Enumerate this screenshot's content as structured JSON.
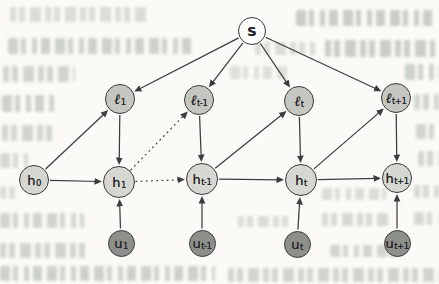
{
  "figure": {
    "type": "graphical-model-diagram",
    "colors": {
      "background": "#fbfaf6",
      "node_border": "#3a3a3a",
      "edge": "#3d3d3d",
      "s_fill": "#fdfdfb",
      "l_fill": "#c6c6c1",
      "h_fill": "#d7d7d2",
      "u_fill": "#8d908a",
      "label": "#242428",
      "bleed_text": "#a9b0a6"
    },
    "nodes": [
      {
        "id": "s",
        "base": "S",
        "sub": "",
        "kind": "s",
        "x": 252,
        "y": 31,
        "r": 14
      },
      {
        "id": "l1",
        "base": "ℓ",
        "sub": "1",
        "kind": "l",
        "x": 120,
        "y": 99,
        "r": 15
      },
      {
        "id": "lt_1",
        "base": "ℓ",
        "sub": "t-1",
        "kind": "l",
        "x": 199,
        "y": 100,
        "r": 15
      },
      {
        "id": "lt",
        "base": "ℓ",
        "sub": "t",
        "kind": "l",
        "x": 299,
        "y": 101,
        "r": 15
      },
      {
        "id": "lt1",
        "base": "ℓ",
        "sub": "t+1",
        "kind": "l",
        "x": 396,
        "y": 98,
        "r": 15
      },
      {
        "id": "h0",
        "base": "h",
        "sub": "0",
        "kind": "h",
        "x": 34,
        "y": 180,
        "r": 15
      },
      {
        "id": "h1",
        "base": "h",
        "sub": "1",
        "kind": "h",
        "x": 119,
        "y": 182,
        "r": 16
      },
      {
        "id": "ht_1",
        "base": "h",
        "sub": "t-1",
        "kind": "h",
        "x": 202,
        "y": 179,
        "r": 16
      },
      {
        "id": "ht",
        "base": "h",
        "sub": "t",
        "kind": "h",
        "x": 301,
        "y": 180,
        "r": 16
      },
      {
        "id": "ht1",
        "base": "h",
        "sub": "t+1",
        "kind": "h",
        "x": 397,
        "y": 178,
        "r": 15
      },
      {
        "id": "u1",
        "base": "u",
        "sub": "1",
        "kind": "u",
        "x": 121,
        "y": 243,
        "r": 13.5
      },
      {
        "id": "ut_1",
        "base": "u",
        "sub": "t-1",
        "kind": "u",
        "x": 202,
        "y": 243,
        "r": 13.5
      },
      {
        "id": "ut",
        "base": "u",
        "sub": "t",
        "kind": "u",
        "x": 297,
        "y": 244,
        "r": 13.5
      },
      {
        "id": "ut1",
        "base": "u",
        "sub": "t+1",
        "kind": "u",
        "x": 397,
        "y": 243,
        "r": 13.5
      }
    ],
    "edges": [
      {
        "from": "s",
        "to": "l1",
        "style": "solid"
      },
      {
        "from": "s",
        "to": "lt_1",
        "style": "solid"
      },
      {
        "from": "s",
        "to": "lt",
        "style": "solid"
      },
      {
        "from": "s",
        "to": "lt1",
        "style": "solid"
      },
      {
        "from": "h0",
        "to": "l1",
        "style": "solid"
      },
      {
        "from": "h0",
        "to": "h1",
        "style": "solid"
      },
      {
        "from": "l1",
        "to": "h1",
        "style": "solid"
      },
      {
        "from": "h1",
        "to": "lt_1",
        "style": "dotted"
      },
      {
        "from": "h1",
        "to": "ht_1",
        "style": "dotted"
      },
      {
        "from": "lt_1",
        "to": "ht_1",
        "style": "solid"
      },
      {
        "from": "ht_1",
        "to": "lt",
        "style": "solid"
      },
      {
        "from": "ht_1",
        "to": "ht",
        "style": "solid"
      },
      {
        "from": "lt",
        "to": "ht",
        "style": "solid"
      },
      {
        "from": "ht",
        "to": "lt1",
        "style": "solid"
      },
      {
        "from": "ht",
        "to": "ht1",
        "style": "solid"
      },
      {
        "from": "lt1",
        "to": "ht1",
        "style": "solid"
      },
      {
        "from": "u1",
        "to": "h1",
        "style": "solid"
      },
      {
        "from": "ut_1",
        "to": "ht_1",
        "style": "solid"
      },
      {
        "from": "ut",
        "to": "ht",
        "style": "solid"
      },
      {
        "from": "ut1",
        "to": "ht1",
        "style": "solid"
      }
    ]
  }
}
